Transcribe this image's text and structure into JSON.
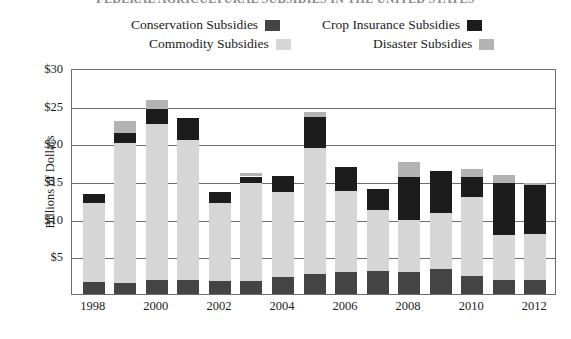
{
  "chart_data": {
    "type": "bar",
    "subtype": "stacked",
    "title": "FEDERAL AGRICULTURAL SUBSIDIES IN THE UNITED STATES",
    "xlabel": "",
    "ylabel": "Billions of Dollars",
    "ylim": [
      0,
      30
    ],
    "ytick_labels": [
      "$30",
      "$25",
      "$20",
      "$15",
      "$10",
      "$5"
    ],
    "ytick_values": [
      30,
      25,
      20,
      15,
      10,
      5
    ],
    "grid": true,
    "legend_position": "top",
    "categories": [
      1998,
      1999,
      2000,
      2001,
      2002,
      2003,
      2004,
      2005,
      2006,
      2007,
      2008,
      2009,
      2010,
      2011,
      2012
    ],
    "xtick_labels": [
      "1998",
      "2000",
      "2002",
      "2004",
      "2006",
      "2008",
      "2010",
      "2012"
    ],
    "series": [
      {
        "name": "Conservation Subsidies",
        "color": "#444444",
        "values": [
          1.6,
          1.5,
          1.8,
          1.8,
          1.7,
          1.7,
          2.2,
          2.6,
          2.9,
          3.0,
          2.9,
          3.3,
          2.4,
          1.9,
          1.8
        ]
      },
      {
        "name": "Commodity Subsidies",
        "color": "#d6d6d6",
        "values": [
          10.5,
          18.6,
          20.8,
          18.6,
          10.4,
          13.0,
          11.4,
          16.8,
          10.8,
          8.2,
          6.9,
          7.5,
          10.5,
          5.9,
          6.2
        ]
      },
      {
        "name": "Crop Insurance Subsidies",
        "color": "#1c1c1c",
        "values": [
          1.2,
          1.3,
          1.9,
          3.0,
          1.5,
          0.9,
          2.0,
          4.1,
          3.1,
          2.7,
          5.7,
          5.5,
          2.6,
          6.9,
          6.5
        ]
      },
      {
        "name": "Disaster Subsidies",
        "color": "#b3b3b3",
        "values": [
          0.0,
          1.6,
          1.2,
          0.0,
          0.0,
          0.5,
          0.0,
          0.6,
          0.0,
          0.0,
          2.0,
          0.0,
          1.1,
          1.1,
          0.3
        ]
      }
    ],
    "totals": [
      13.3,
      23.0,
      25.7,
      23.4,
      13.6,
      16.1,
      15.6,
      24.1,
      16.8,
      13.9,
      17.5,
      16.3,
      16.6,
      15.8,
      14.8
    ],
    "axis_color": "#6d6d6d"
  },
  "legend": {
    "items": [
      {
        "label": "Conservation Subsidies",
        "color": "#444444"
      },
      {
        "label": "Crop Insurance Subsidies",
        "color": "#1c1c1c"
      },
      {
        "label": "Commodity Subsidies",
        "color": "#d6d6d6"
      },
      {
        "label": "Disaster Subsidies",
        "color": "#b3b3b3"
      }
    ]
  }
}
